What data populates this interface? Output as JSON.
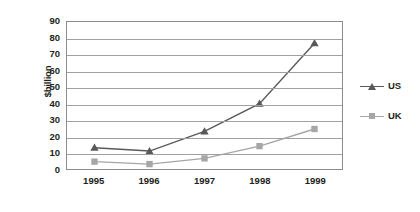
{
  "chart_data": {
    "type": "line",
    "title": "",
    "xlabel": "",
    "ylabel": "$billion",
    "categories": [
      "1995",
      "1996",
      "1997",
      "1998",
      "1999"
    ],
    "ylim": [
      0,
      90
    ],
    "ytick_step": 10,
    "yticks": [
      "90",
      "80",
      "70",
      "60",
      "50",
      "40",
      "30",
      "20",
      "10",
      "0"
    ],
    "grid": true,
    "legend_position": "right",
    "series": [
      {
        "name": "US",
        "values": [
          13,
          11,
          23,
          40,
          77
        ],
        "color": "#595959",
        "marker": "triangle"
      },
      {
        "name": "UK",
        "values": [
          4.5,
          3,
          6.5,
          14,
          24.5
        ],
        "color": "#a6a6a6",
        "marker": "square"
      }
    ]
  },
  "legend": {
    "items": [
      {
        "label": "US"
      },
      {
        "label": "UK"
      }
    ]
  },
  "axes": {
    "y_title": "$billion"
  }
}
